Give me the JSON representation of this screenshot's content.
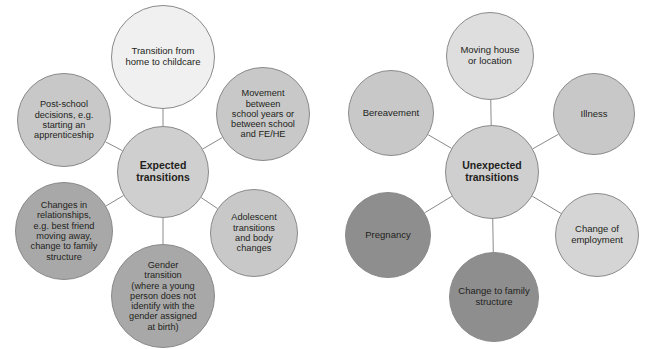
{
  "diagram": {
    "type": "two-hub-radial-bubble-diagram",
    "background_color": "#ffffff",
    "border_color": "#8a8a8a",
    "text_color": "#231f20",
    "clusters": [
      {
        "id": "expected",
        "hub": {
          "id": "expected-hub",
          "label": "Expected\ntransitions",
          "cx": 163,
          "cy": 172,
          "r": 46,
          "fill": "#cfcfcf",
          "font_size": 10.5,
          "bold": true
        },
        "satellites": [
          {
            "id": "transition-home-to-childcare",
            "label": "Transition from\nhome to childcare",
            "cx": 163,
            "cy": 57,
            "r": 52,
            "fill": "#f0f0f0",
            "font_size": 9.5
          },
          {
            "id": "movement-between-school",
            "label": "Movement\nbetween\nschool years or\nbetween school\nand FE/HE",
            "cx": 263,
            "cy": 114,
            "r": 47,
            "fill": "#c8c8c8",
            "font_size": 9.2
          },
          {
            "id": "adolescent-transitions",
            "label": "Adolescent\ntransitions\nand body\nchanges",
            "cx": 254,
            "cy": 233,
            "r": 44,
            "fill": "#c8c8c8",
            "font_size": 9.2
          },
          {
            "id": "gender-transition",
            "label": "Gender\ntransition\n(where a young\nperson does not\nidentify with the\ngender assigned\nat birth)",
            "cx": 163,
            "cy": 296,
            "r": 52,
            "fill": "#a8a8a8",
            "font_size": 9.2
          },
          {
            "id": "changes-in-relationships",
            "label": "Changes in\nrelationships,\ne.g. best friend\nmoving away,\nchange to family\nstructure",
            "cx": 64,
            "cy": 231,
            "r": 49,
            "fill": "#a8a8a8",
            "font_size": 9.2
          },
          {
            "id": "post-school-decisions",
            "label": "Post-school\ndecisions, e.g.\nstarting an\napprenticeship",
            "cx": 64,
            "cy": 120,
            "r": 47,
            "fill": "#c8c8c8",
            "font_size": 9.2
          }
        ]
      },
      {
        "id": "unexpected",
        "hub": {
          "id": "unexpected-hub",
          "label": "Unexpected\ntransitions",
          "cx": 492,
          "cy": 172,
          "r": 47,
          "fill": "#cfcfcf",
          "font_size": 10.5,
          "bold": true
        },
        "satellites": [
          {
            "id": "moving-house-or-location",
            "label": "Moving house\nor location",
            "cx": 490,
            "cy": 56,
            "r": 44,
            "fill": "#dedede",
            "font_size": 9.5
          },
          {
            "id": "illness",
            "label": "Illness",
            "cx": 594,
            "cy": 114,
            "r": 41,
            "fill": "#c8c8c8",
            "font_size": 9.5
          },
          {
            "id": "change-of-employment",
            "label": "Change of\nemployment",
            "cx": 597,
            "cy": 235,
            "r": 42,
            "fill": "#d5d5d5",
            "font_size": 9.5
          },
          {
            "id": "change-to-family-structure",
            "label": "Change to family\nstructure",
            "cx": 494,
            "cy": 297,
            "r": 45,
            "fill": "#8e8e8e",
            "font_size": 9.5
          },
          {
            "id": "pregnancy",
            "label": "Pregnancy",
            "cx": 388,
            "cy": 235,
            "r": 43,
            "fill": "#8e8e8e",
            "font_size": 9.5
          },
          {
            "id": "bereavement",
            "label": "Bereavement",
            "cx": 391,
            "cy": 113,
            "r": 43,
            "fill": "#c8c8c8",
            "font_size": 9.5
          }
        ]
      }
    ]
  }
}
